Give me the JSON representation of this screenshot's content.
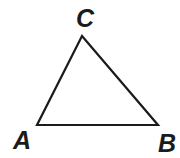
{
  "diagram": {
    "type": "triangle",
    "background_color": "#ffffff",
    "stroke_color": "#1b1b1b",
    "stroke_width": 2.2,
    "vertices": [
      {
        "label": "A",
        "x": 37,
        "y": 125,
        "label_x": 22,
        "label_y": 149
      },
      {
        "label": "B",
        "x": 158,
        "y": 125,
        "label_x": 167,
        "label_y": 152
      },
      {
        "label": "C",
        "x": 82,
        "y": 36,
        "label_x": 85,
        "label_y": 27
      }
    ]
  }
}
